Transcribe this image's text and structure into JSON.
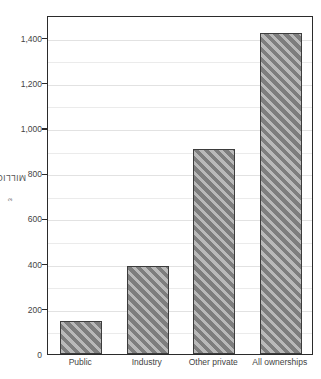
{
  "chart_data": {
    "type": "bar",
    "title": "",
    "subtitle": "",
    "xlabel": "",
    "ylabel": "MILLION m3",
    "ylabel_text": "MILLION m",
    "ylabel_superscript": "3",
    "categories": [
      "Public",
      "Industry",
      "Other private",
      "All ownerships"
    ],
    "values": [
      146,
      390,
      908,
      1422
    ],
    "series": [
      {
        "name": "Volume",
        "values": [
          146,
          390,
          908,
          1422
        ]
      }
    ],
    "ylim": [
      0,
      1500
    ],
    "xlim_categories": 4,
    "y_major_ticks": [
      0,
      200,
      400,
      600,
      800,
      1000,
      1200,
      1400
    ],
    "y_major_tick_labels": [
      "0",
      "200",
      "400",
      "600",
      "800",
      "1,000",
      "1,200",
      "1,400"
    ],
    "y_minor_gridlines": [
      100,
      300,
      500,
      700,
      900,
      1100,
      1300,
      1500
    ],
    "grid": true,
    "grid_color": "#ebebeb",
    "legend": false,
    "legend_position": "none",
    "bar_fill_color": "#8c8c8c",
    "bar_hatch": "diagonal-forward",
    "bar_hatch_light": "#b9b9b9",
    "bar_hatch_dark": "#7e7e7e",
    "bar_border_color": "#3d3d3d",
    "axis_color": "#2b2b2b",
    "text_color": "#444444",
    "background_color": "#ffffff",
    "annotations": []
  }
}
